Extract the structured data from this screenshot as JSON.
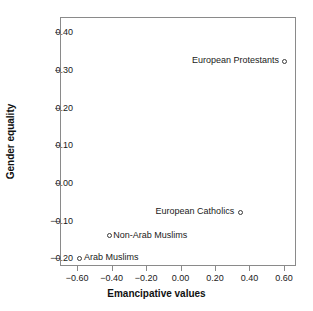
{
  "chart_data": {
    "type": "scatter",
    "title": "",
    "xlabel": "Emancipative values",
    "ylabel": "Gender equality",
    "xlim": [
      -0.7,
      0.67
    ],
    "ylim": [
      -0.22,
      0.44
    ],
    "xticks": [
      -0.6,
      -0.4,
      -0.2,
      0.0,
      0.2,
      0.4,
      0.6
    ],
    "xticklabels": [
      "−0.60",
      "−0.40",
      "−0.20",
      "0.00",
      "0.20",
      "0.40",
      "0.60"
    ],
    "yticks": [
      0.4,
      0.3,
      0.2,
      0.1,
      0.0,
      -0.1,
      -0.2
    ],
    "yticklabels": [
      "0.40",
      "0.30",
      "0.20",
      "0.10",
      "0.00",
      "−0.10",
      "−0.20"
    ],
    "grid": false,
    "legend": "none",
    "marker": "open-circle",
    "marker_color": "#3a3a3a",
    "points": [
      {
        "label": "European Protestants",
        "x": 0.6,
        "y": 0.325,
        "label_side": "left"
      },
      {
        "label": "European Catholics",
        "x": 0.34,
        "y": -0.075,
        "label_side": "left"
      },
      {
        "label": "Non-Arab Muslims",
        "x": -0.42,
        "y": -0.137,
        "label_side": "right"
      },
      {
        "label": "Arab Muslims",
        "x": -0.59,
        "y": -0.197,
        "label_side": "right"
      }
    ]
  }
}
